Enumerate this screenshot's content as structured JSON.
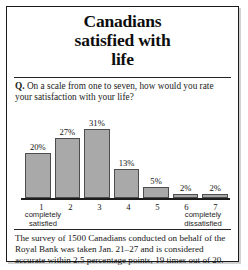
{
  "title": {
    "line1": "Canadians",
    "line2": "satisfied with",
    "line3": "life"
  },
  "question": {
    "prefix": "Q.",
    "text": "On a scale from one to seven, how would you rate your satisfaction with your life?"
  },
  "captions": {
    "left": "completely\nsatisfied",
    "left_line1": "completely",
    "left_line2": "satisfied",
    "right_line1": "completely",
    "right_line2": "dissatisfied"
  },
  "footnote": "The survey of 1500 Canadians conducted on behalf of the Royal Bank was taken Jan. 21–27 and is considered accurate within 2.5 percentage points, 19 times out of 20.",
  "colors": {
    "bar_fill": "#a9a9a9",
    "bar_stroke": "#4d4d4d",
    "axis": "#1d1d1d",
    "border": "#1a1a1a",
    "background": "#ffffff",
    "text": "#141414"
  },
  "chart_data": {
    "type": "bar",
    "title": "Canadians satisfied with life",
    "categories": [
      "1",
      "2",
      "3",
      "4",
      "5",
      "6",
      "7"
    ],
    "values": [
      20,
      27,
      31,
      13,
      5,
      2,
      2
    ],
    "data_labels": [
      "20%",
      "27%",
      "31%",
      "13%",
      "5%",
      "2%",
      "2%"
    ],
    "xlabel": "",
    "ylabel": "",
    "ylim": [
      0,
      35
    ],
    "grid": false,
    "legend": false,
    "units": "percent",
    "scale_anchor_low": "1 completely satisfied",
    "scale_anchor_high": "7 completely dissatisfied"
  }
}
